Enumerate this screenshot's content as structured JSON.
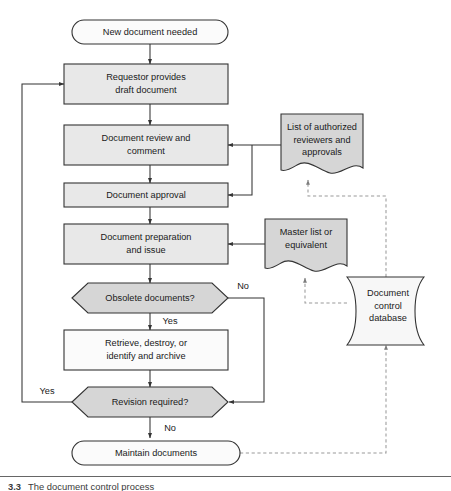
{
  "diagram": {
    "title_caption": {
      "number": "3.3",
      "text": "The document control process"
    },
    "nodes": [
      {
        "id": "start",
        "label": "New document needed",
        "shape": "terminator",
        "fill": "#fbfbfb"
      },
      {
        "id": "requestor",
        "label": "Requestor provides\ndraft document",
        "shape": "process",
        "fill": "#e8e8e8"
      },
      {
        "id": "review",
        "label": "Document review and\ncomment",
        "shape": "process",
        "fill": "#e8e8e8"
      },
      {
        "id": "approval",
        "label": "Document approval",
        "shape": "process",
        "fill": "#e8e8e8"
      },
      {
        "id": "preparation",
        "label": "Document preparation\nand issue",
        "shape": "process",
        "fill": "#e8e8e8"
      },
      {
        "id": "obsolete",
        "label": "Obsolete documents?",
        "shape": "decision",
        "fill": "#d6d6d6"
      },
      {
        "id": "retrieve",
        "label": "Retrieve, destroy, or\nidentify and archive",
        "shape": "process",
        "fill": "#e8e8e8"
      },
      {
        "id": "revision",
        "label": "Revision required?",
        "shape": "decision",
        "fill": "#d6d6d6"
      },
      {
        "id": "maintain",
        "label": "Maintain documents",
        "shape": "terminator",
        "fill": "#fbfbfb"
      },
      {
        "id": "authlist",
        "label": "List of authorized\nreviewers and\napprovals",
        "shape": "document",
        "fill": "#d6d6d6"
      },
      {
        "id": "masterlist",
        "label": "Master list or\nequivalent",
        "shape": "document",
        "fill": "#d6d6d6"
      },
      {
        "id": "database",
        "label": "Document\ncontrol\ndatabase",
        "shape": "database",
        "fill": "#f7f7f7"
      }
    ],
    "node_lines": {
      "start": [
        "New document needed"
      ],
      "requestor": [
        "Requestor provides",
        "draft document"
      ],
      "review": [
        "Document review and",
        "comment"
      ],
      "approval": [
        "Document approval"
      ],
      "preparation": [
        "Document preparation",
        "and issue"
      ],
      "obsolete": [
        "Obsolete documents?"
      ],
      "retrieve": [
        "Retrieve, destroy, or",
        "identify and archive"
      ],
      "revision": [
        "Revision required?"
      ],
      "maintain": [
        "Maintain documents"
      ],
      "authlist": [
        "List of authorized",
        "reviewers and",
        "approvals"
      ],
      "masterlist": [
        "Master list or",
        "equivalent"
      ],
      "database": [
        "Document",
        "control",
        "database"
      ]
    },
    "edge_labels": {
      "obsolete_no": "No",
      "obsolete_yes": "Yes",
      "revision_yes": "Yes",
      "revision_no": "No"
    },
    "colors": {
      "process_fill": "#e8e8e8",
      "decision_fill": "#d6d6d6",
      "document_fill": "#d6d6d6",
      "terminator_fill": "#fbfbfb",
      "database_fill": "#f7f7f7",
      "stroke": "#333333",
      "dashed_stroke": "#9a9a9a",
      "text": "#1a1a1a"
    }
  }
}
